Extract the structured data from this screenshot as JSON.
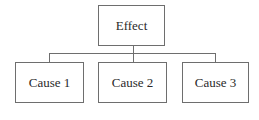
{
  "diagram": {
    "type": "tree",
    "root": {
      "label": "Effect"
    },
    "children": [
      {
        "label": "Cause 1"
      },
      {
        "label": "Cause 2"
      },
      {
        "label": "Cause 3"
      }
    ],
    "colors": {
      "border": "#6e6e6e",
      "text": "#2a2a2a",
      "background": "#ffffff"
    }
  }
}
